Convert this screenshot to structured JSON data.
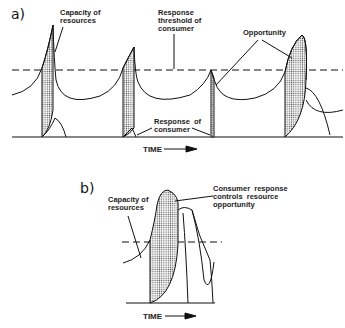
{
  "panel_a": {
    "label": "a)",
    "capacity_label": "Capacity of\nresources",
    "threshold_label": "Response\nthreshold of\nconsumer",
    "opportunity_label": "Opportunity",
    "response_label": "Response  of\nconsumer",
    "time_label": "TIME"
  },
  "panel_b": {
    "label": "b)",
    "capacity_label": "Capacity of\nresources",
    "consumer_label": "Consumer  response\ncontrols  resource\nopportunity",
    "time_label": "TIME"
  },
  "colors": {
    "line": "#111111",
    "stipple": "#555555",
    "background": "#ffffff"
  }
}
